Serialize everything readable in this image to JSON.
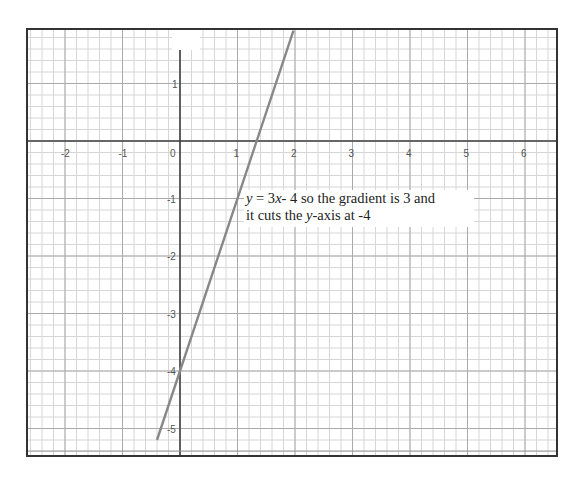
{
  "chart_data": {
    "type": "line",
    "title": "",
    "xlabel": "",
    "ylabel": "",
    "equation": "y = 3x - 4",
    "series": [
      {
        "name": "y = 3x - 4",
        "slope": 3,
        "intercept": -4,
        "x": [
          -0.4,
          1.973
        ],
        "y": [
          -5.2,
          1.92
        ],
        "color": "#888888"
      }
    ],
    "xlim": [
      -2.64,
      6.6
    ],
    "ylim": [
      -5.35,
      1.93
    ],
    "x_ticks": [
      -2,
      -1,
      0,
      1,
      2,
      3,
      4,
      5,
      6
    ],
    "y_ticks": [
      1,
      -1,
      -2,
      -3,
      -4,
      -5
    ],
    "grid": {
      "major": true,
      "minor": true,
      "minor_per_unit": 5
    },
    "legend": null
  },
  "annotation": {
    "line1_var": "y",
    "line1_eq": " = 3",
    "line1_x": "x",
    "line1_rest": "- 4  so the gradient is 3 and",
    "line2_a": "it cuts the ",
    "line2_var": "y",
    "line2_b": "-axis at -4"
  },
  "caption": ""
}
